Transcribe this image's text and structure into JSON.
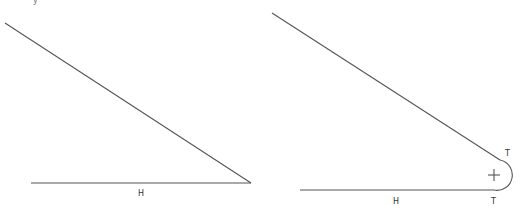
{
  "figures": {
    "left": {
      "title": "Sharp corner (no fillet)",
      "labels": {
        "h": "H"
      }
    },
    "right": {
      "title": "Corner with fillet arc",
      "labels": {
        "h": "H",
        "t_top": "T",
        "t_bottom": "T",
        "center": "+"
      }
    }
  },
  "top_fragment": "y"
}
